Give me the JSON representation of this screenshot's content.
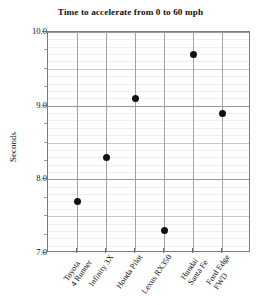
{
  "chart_data": {
    "type": "scatter",
    "title": "Time to accelerate from 0 to 60 mph",
    "xlabel": "",
    "ylabel": "Seconds",
    "categories": [
      "Toyota 4 Runner",
      "Infinity 3X",
      "Honda Pilot",
      "Lexus RX350",
      "Hundai Santa Fe",
      "Ford Edge FWD"
    ],
    "category_lines": [
      [
        "Toyota",
        "4 Runner"
      ],
      [
        "Infinity 3X"
      ],
      [
        "Honda Pilot"
      ],
      [
        "Lexus RX350"
      ],
      [
        "Hundai",
        "Santa Fe"
      ],
      [
        "Ford Edge",
        "FWD"
      ]
    ],
    "values": [
      7.7,
      8.3,
      9.1,
      7.3,
      9.7,
      8.9
    ],
    "ylim": [
      7.0,
      10.0
    ],
    "ytick_labels": [
      "7.0",
      "8.0",
      "9.0",
      "10.0"
    ],
    "ytick_values": [
      7.0,
      8.0,
      9.0,
      10.0
    ],
    "yminor_step": 0.1,
    "grid": true,
    "legend": "none",
    "marker_color": "#111111",
    "point_count": 6
  },
  "style": {
    "background": "#ffffff",
    "axis_color": "#7b7b7b",
    "grid_major_color": "#9a9a9a",
    "grid_minor_color": "#eceff1",
    "text_color": "#111111"
  }
}
